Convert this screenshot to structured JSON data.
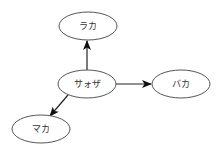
{
  "diagram": {
    "type": "directed-graph",
    "nodes": [
      {
        "id": "center",
        "label": "サォザ",
        "cx": 87,
        "cy": 84,
        "rx": 29,
        "ry": 14
      },
      {
        "id": "top",
        "label": "ラカ",
        "cx": 88,
        "cy": 26,
        "rx": 29,
        "ry": 14
      },
      {
        "id": "right",
        "label": "バカ",
        "cx": 181,
        "cy": 84,
        "rx": 29,
        "ry": 14
      },
      {
        "id": "bottom-left",
        "label": "マカ",
        "cx": 41,
        "cy": 129,
        "rx": 29,
        "ry": 14
      }
    ],
    "edges": [
      {
        "from": "サォザ",
        "to": "ラカ"
      },
      {
        "from": "サォザ",
        "to": "バカ"
      },
      {
        "from": "サォザ",
        "to": "マカ"
      }
    ],
    "colors": {
      "node_stroke": "#555555",
      "edge_stroke": "#222222",
      "background": "#ffffff"
    }
  }
}
